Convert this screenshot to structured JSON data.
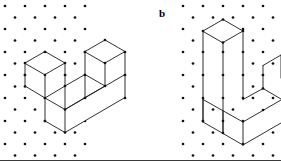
{
  "figure": {
    "caption_labels": [
      {
        "id": "b",
        "text": "b"
      }
    ],
    "background_color": "#ffffff",
    "ink_color": "#1a1a1a",
    "dot_color": "#111111",
    "dot_radius": 1.35,
    "line_width": 0.9,
    "lattice": {
      "type": "triangular-isometric",
      "dx": 20,
      "dy": 11.5,
      "left_grid": {
        "origin_x": 5,
        "origin_y": 6,
        "cols": 6,
        "rows": 14
      },
      "right_grid": {
        "origin_x": 183,
        "origin_y": 6,
        "cols": 6,
        "rows": 14
      }
    },
    "shapes": [
      {
        "id": "a",
        "name": "u-solid-left",
        "outline": "M 25,63 L 45,51.5 L 65,63 L 65,86 L 85,74.5 L 85,51.5 L 105,40 L 125,51.5 L 125,97.5 L 65,132.5 L 45,121 L 45,98 L 25,86 Z",
        "polys": [
          {
            "name": "left-prong-top",
            "pts": "25,63 45,51.5 65,63 45,74.5"
          },
          {
            "name": "left-prong-front-left",
            "pts": "25,63 45,74.5 45,98 25,86"
          },
          {
            "name": "left-prong-front-right",
            "pts": "45,74.5 65,63 65,86 45,98"
          },
          {
            "name": "right-prong-top",
            "pts": "85,51.5 105,40 125,51.5 105,63"
          },
          {
            "name": "right-prong-front-left",
            "pts": "85,51.5 105,63 105,86 85,74.5"
          },
          {
            "name": "right-prong-front-right",
            "pts": "105,63 125,51.5 125,74.5 105,86"
          },
          {
            "name": "base-top-inner",
            "pts": "65,86 85,74.5 105,86 85,97.5"
          },
          {
            "name": "base-front-left",
            "pts": "45,98 65,109.5 65,132.5 45,121"
          },
          {
            "name": "base-front-right",
            "pts": "65,109.5 125,74.5 125,97.5 65,132.5"
          }
        ],
        "edges": [
          "25,63 45,51.5",
          "45,51.5 65,63",
          "65,63 45,74.5",
          "45,74.5 25,63",
          "25,63 25,86",
          "45,74.5 45,121",
          "65,63 65,86",
          "25,86 45,98",
          "45,98 65,86",
          "85,51.5 105,40",
          "105,40 125,51.5",
          "125,51.5 105,63",
          "105,63 85,51.5",
          "85,51.5 85,74.5",
          "105,63 105,86",
          "125,51.5 125,97.5",
          "65,86 85,74.5",
          "85,74.5 105,86",
          "45,98 65,109.5",
          "65,109.5 125,74.5",
          "45,121 65,132.5",
          "65,132.5 125,97.5",
          "45,98 45,121",
          "65,109.5 65,132.5",
          "85,74.5 85,97.5",
          "85,97.5 105,86"
        ]
      },
      {
        "id": "b",
        "name": "u-solid-right",
        "outline": "M 203,31 L 223,19.5 L 243,31 L 243,100 L 263,88.5 L 263,65.5 L 281,55 L 281,123 L 243,145 L 223,133.5 L 203,122 Z",
        "polys": [
          {
            "name": "left-prong-top",
            "pts": "203,31 223,19.5 243,31 223,42.5"
          },
          {
            "name": "left-prong-front-left",
            "pts": "203,31 223,42.5 223,111 203,99.5"
          },
          {
            "name": "left-prong-front-right",
            "pts": "223,42.5 243,31 243,99.5 223,111"
          },
          {
            "name": "right-prong-top",
            "pts": "263,65.5 281,55 281,78 263,88.5"
          },
          {
            "name": "base-top-inner",
            "pts": "243,99.5 263,88.5 281,99 243,122"
          },
          {
            "name": "base-front",
            "pts": "203,99.5 223,111 243,122 281,100 281,123 243,145 223,133.5 203,122"
          }
        ],
        "edges": [
          "203,31 223,19.5",
          "223,19.5 243,31",
          "243,31 223,42.5",
          "223,42.5 203,31",
          "203,31 203,122",
          "223,42.5 223,133.5",
          "243,31 243,99.5",
          "263,65.5 281,55",
          "263,65.5 263,88.5",
          "281,55 281,78",
          "243,99.5 263,88.5",
          "263,88.5 281,99",
          "203,99.5 243,122",
          "243,122 281,100",
          "203,122 243,145",
          "243,145 281,123",
          "203,99.5 203,122",
          "243,122 243,145",
          "281,99 281,123"
        ]
      }
    ]
  }
}
